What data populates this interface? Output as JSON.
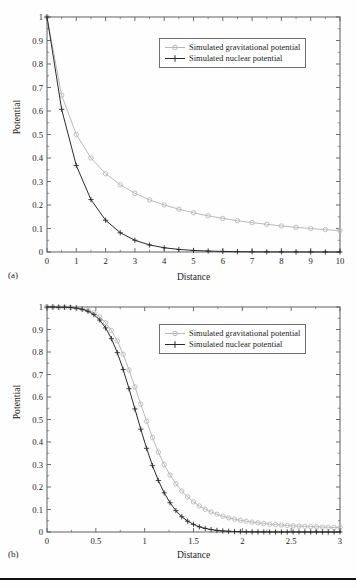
{
  "figure": {
    "panel_a_label": "(a)",
    "panel_b_label": "(b)",
    "axis_title_x": "Distance",
    "axis_title_y": "Potential",
    "legend_gravitational": "Simulated gravitational potential",
    "legend_nuclear": "Simulated nuclear potential",
    "colors": {
      "gravitational": "#b9b9b9",
      "nuclear": "#2b2b2b",
      "axis": "#5f5f5f",
      "text": "#1a1a1a",
      "legend_border": "#6e6e6e",
      "background": "#fefefe",
      "rule": "#111111"
    }
  },
  "chart_data": [
    {
      "type": "line",
      "panel": "(a)",
      "title": "",
      "xlabel": "Distance",
      "ylabel": "Potential",
      "xlim": [
        0,
        10
      ],
      "ylim": [
        0,
        1
      ],
      "xticks": [
        0,
        1,
        2,
        3,
        4,
        5,
        6,
        7,
        8,
        9,
        10
      ],
      "xtick_labels": [
        "0",
        "1",
        "2",
        "3",
        "4",
        "5",
        "6",
        "7",
        "8",
        "9",
        "10"
      ],
      "yticks": [
        0,
        0.1,
        0.2,
        0.3,
        0.4,
        0.5,
        0.6,
        0.7,
        0.8,
        0.9,
        1
      ],
      "ytick_labels": [
        "0",
        "0.1",
        "0.2",
        "0.3",
        "0.4",
        "0.5",
        "0.6",
        "0.7",
        "0.8",
        "0.9",
        "1"
      ],
      "grid": false,
      "legend_position": "upper right",
      "x": [
        0,
        0.5,
        1,
        1.5,
        2,
        2.5,
        3,
        3.5,
        4,
        4.5,
        5,
        5.5,
        6,
        6.5,
        7,
        7.5,
        8,
        8.5,
        9,
        9.5,
        10
      ],
      "series": [
        {
          "name": "Simulated gravitational potential",
          "marker": "circle",
          "color": "#b9b9b9",
          "values": [
            1,
            0.667,
            0.5,
            0.4,
            0.333,
            0.286,
            0.25,
            0.222,
            0.2,
            0.182,
            0.167,
            0.154,
            0.143,
            0.133,
            0.125,
            0.118,
            0.111,
            0.105,
            0.1,
            0.0952,
            0.0909
          ]
        },
        {
          "name": "Simulated nuclear potential",
          "marker": "plus",
          "color": "#2b2b2b",
          "values": [
            1,
            0.607,
            0.368,
            0.223,
            0.135,
            0.082,
            0.05,
            0.03,
            0.018,
            0.011,
            0.0067,
            0.0041,
            0.0025,
            0.0015,
            0.0009,
            0.00055,
            0.00034,
            0.0002,
            0.00012,
            7e-05,
            4.5e-05
          ]
        }
      ]
    },
    {
      "type": "line",
      "panel": "(b)",
      "title": "",
      "xlabel": "Distance",
      "ylabel": "Potential",
      "xlim": [
        0,
        3
      ],
      "ylim": [
        0,
        1
      ],
      "xticks": [
        0,
        0.5,
        1,
        1.5,
        2,
        2.5,
        3
      ],
      "xtick_labels": [
        "0",
        "0.5",
        "1",
        "1.5",
        "2",
        "2.5",
        "3"
      ],
      "yticks": [
        0,
        0.1,
        0.2,
        0.3,
        0.4,
        0.5,
        0.6,
        0.7,
        0.8,
        0.9,
        1
      ],
      "ytick_labels": [
        "0",
        "0.1",
        "0.2",
        "0.3",
        "0.4",
        "0.5",
        "0.6",
        "0.7",
        "0.8",
        "0.9",
        "1"
      ],
      "grid": false,
      "legend_position": "upper right",
      "x": [
        0,
        0.06,
        0.12,
        0.18,
        0.24,
        0.3,
        0.36,
        0.42,
        0.48,
        0.54,
        0.6,
        0.66,
        0.72,
        0.78,
        0.84,
        0.9,
        0.96,
        1.02,
        1.08,
        1.14,
        1.2,
        1.26,
        1.32,
        1.38,
        1.44,
        1.5,
        1.56,
        1.62,
        1.68,
        1.74,
        1.8,
        1.86,
        1.92,
        1.98,
        2.04,
        2.1,
        2.16,
        2.22,
        2.28,
        2.34,
        2.4,
        2.46,
        2.52,
        2.58,
        2.64,
        2.7,
        2.76,
        2.82,
        2.88,
        2.94,
        3
      ],
      "series": [
        {
          "name": "Simulated gravitational potential",
          "marker": "circle",
          "color": "#b9b9b9",
          "values": [
            1,
            1,
            0.999,
            0.999,
            0.998,
            0.996,
            0.992,
            0.985,
            0.974,
            0.956,
            0.93,
            0.895,
            0.849,
            0.79,
            0.72,
            0.645,
            0.568,
            0.492,
            0.42,
            0.355,
            0.3,
            0.253,
            0.214,
            0.182,
            0.156,
            0.134,
            0.116,
            0.101,
            0.089,
            0.079,
            0.07,
            0.063,
            0.057,
            0.052,
            0.048,
            0.044,
            0.041,
            0.038,
            0.035,
            0.033,
            0.031,
            0.029,
            0.027,
            0.026,
            0.025,
            0.024,
            0.023,
            0.022,
            0.021,
            0.02,
            0.02
          ]
        },
        {
          "name": "Simulated nuclear potential",
          "marker": "plus",
          "color": "#2b2b2b",
          "values": [
            1,
            1,
            0.999,
            0.999,
            0.998,
            0.995,
            0.99,
            0.981,
            0.966,
            0.942,
            0.907,
            0.859,
            0.797,
            0.722,
            0.637,
            0.547,
            0.457,
            0.372,
            0.295,
            0.229,
            0.174,
            0.13,
            0.095,
            0.068,
            0.048,
            0.034,
            0.023,
            0.016,
            0.011,
            0.0072,
            0.0048,
            0.0032,
            0.0021,
            0.0014,
            0.0009,
            0.0006,
            0.0004,
            0.00026,
            0.00017,
            0.00011,
            7e-05,
            5e-05,
            3e-05,
            2e-05,
            1.3e-05,
            9e-06,
            6e-06,
            4e-06,
            2.5e-06,
            1.6e-06,
            1e-06
          ]
        }
      ]
    }
  ]
}
